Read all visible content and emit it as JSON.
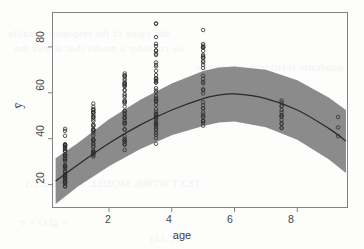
{
  "figure": {
    "kind": "r-base-scatterplot-with-fit",
    "background_color": "#fdfdfc",
    "box_color": "#848484",
    "band_color": "#8b8b8b",
    "curve_color": "#2a2a2a",
    "point_color": "#2f2f2f"
  },
  "bleed_text": {
    "lines": [
      "the value of the response variable",
      "we consider a model that allows the",
      "quadratic relationship between",
      "TEXT WORK MODEL – FIVE  2.5.1",
      "= g(x) + e",
      "(2.14)"
    ]
  },
  "chart_data": {
    "type": "scatter",
    "title": "",
    "subtitle": "",
    "xlabel": "age",
    "ylabel": "ȳ",
    "xlim": [
      0.2,
      9.6
    ],
    "ylim": [
      10,
      95
    ],
    "xticks": [
      2,
      4,
      6,
      8
    ],
    "yticks": [
      20,
      40,
      60,
      80
    ],
    "xtick_labels": [
      "2",
      "4",
      "6",
      "8"
    ],
    "ytick_labels": [
      "20",
      "40",
      "60",
      "80"
    ],
    "grid": false,
    "legend": false,
    "legend_position": "none",
    "series": [
      {
        "name": "observations",
        "type": "scatter",
        "marker": "open-circle",
        "marker_size": 3,
        "note": "observations occur in discrete age columns; values jittered vertically within each column",
        "columns": [
          {
            "x": 0.6,
            "n": 46,
            "y_min": 19.0,
            "y_max": 45.0,
            "y_dense_min": 20.0,
            "y_dense_max": 38.0
          },
          {
            "x": 1.5,
            "n": 40,
            "y_min": 30.0,
            "y_max": 57.0,
            "y_dense_min": 33.0,
            "y_dense_max": 53.0
          },
          {
            "x": 2.5,
            "n": 44,
            "y_min": 34.5,
            "y_max": 74.0,
            "y_dense_min": 37.0,
            "y_dense_max": 68.0
          },
          {
            "x": 3.5,
            "n": 48,
            "y_min": 36.5,
            "y_max": 92.0,
            "y_dense_min": 40.0,
            "y_dense_max": 82.0
          },
          {
            "x": 5.0,
            "n": 34,
            "y_min": 43.0,
            "y_max": 88.0,
            "y_dense_min": 45.0,
            "y_dense_max": 81.0
          },
          {
            "x": 7.5,
            "n": 14,
            "y_min": 38.5,
            "y_max": 68.0,
            "y_dense_min": 44.0,
            "y_dense_max": 57.0
          },
          {
            "x": 9.3,
            "n": 3,
            "y_min": 36.0,
            "y_max": 53.0,
            "y_dense_min": 36.0,
            "y_dense_max": 53.0
          }
        ]
      },
      {
        "name": "fitted quadratic curve",
        "type": "line",
        "x": [
          0.3,
          1.0,
          2.0,
          3.0,
          4.0,
          5.0,
          5.5,
          6.0,
          7.0,
          8.0,
          9.0,
          9.55
        ],
        "y": [
          21.5,
          28.5,
          38.0,
          46.0,
          52.5,
          57.5,
          59.0,
          59.5,
          57.5,
          52.5,
          44.5,
          39.0
        ]
      },
      {
        "name": "confidence band upper",
        "type": "line",
        "x": [
          0.3,
          1.0,
          2.0,
          3.0,
          4.0,
          5.0,
          5.5,
          6.0,
          7.0,
          8.0,
          9.0,
          9.55
        ],
        "y": [
          31.5,
          38.0,
          48.5,
          57.0,
          64.0,
          69.5,
          71.0,
          71.5,
          70.0,
          65.5,
          58.0,
          52.5
        ]
      },
      {
        "name": "confidence band lower",
        "type": "line",
        "x": [
          0.3,
          1.0,
          2.0,
          3.0,
          4.0,
          5.0,
          5.5,
          6.0,
          7.0,
          8.0,
          9.0,
          9.55
        ],
        "y": [
          11.5,
          19.0,
          28.0,
          35.5,
          41.5,
          45.5,
          47.0,
          47.5,
          45.0,
          39.5,
          31.0,
          25.0
        ]
      }
    ],
    "annotations": []
  }
}
